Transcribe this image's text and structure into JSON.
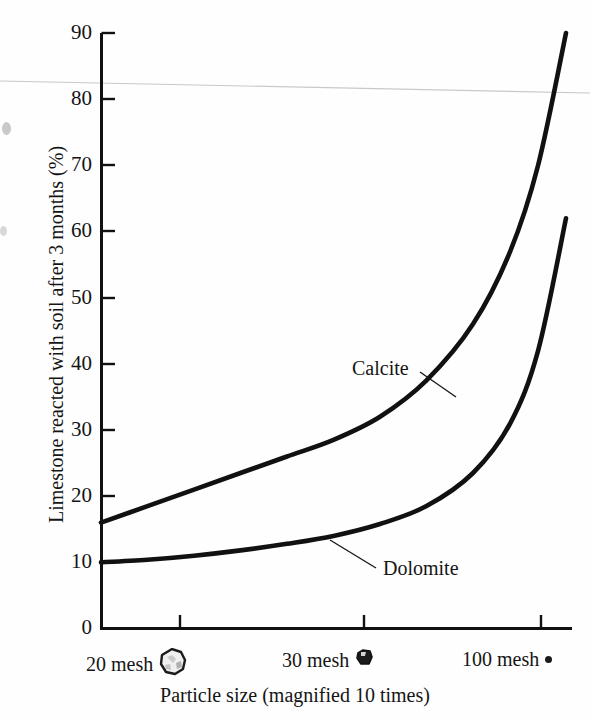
{
  "chart_data": {
    "type": "line",
    "title": "",
    "xlabel": "Particle size (magnified 10 times)",
    "ylabel": "Limestone reacted with soil after 3 months (%)",
    "ylim": [
      0,
      90
    ],
    "yticks": [
      0,
      10,
      20,
      30,
      40,
      50,
      60,
      70,
      80,
      90
    ],
    "ytick_labels": [
      "0",
      "10",
      "20",
      "30",
      "40",
      "50",
      "60",
      "70",
      "80",
      "90"
    ],
    "xtick_labels": [
      "20 mesh",
      "30 mesh",
      "100 mesh"
    ],
    "xtick_icons": [
      "rock-large-icon",
      "rock-small-icon",
      "dot-icon"
    ],
    "xtick_positions": [
      0.168,
      0.558,
      0.934
    ],
    "grid": false,
    "legend": "inline-annotations",
    "series": [
      {
        "name": "Calcite",
        "color": "#111111",
        "points": [
          {
            "x": 0.0,
            "y": 16.0
          },
          {
            "x": 0.1,
            "y": 18.5
          },
          {
            "x": 0.2,
            "y": 21.0
          },
          {
            "x": 0.3,
            "y": 23.5
          },
          {
            "x": 0.4,
            "y": 26.0
          },
          {
            "x": 0.5,
            "y": 28.5
          },
          {
            "x": 0.6,
            "y": 32.0
          },
          {
            "x": 0.7,
            "y": 37.5
          },
          {
            "x": 0.8,
            "y": 46.0
          },
          {
            "x": 0.88,
            "y": 57.0
          },
          {
            "x": 0.94,
            "y": 70.0
          },
          {
            "x": 1.0,
            "y": 90.0
          }
        ]
      },
      {
        "name": "Dolomite",
        "color": "#111111",
        "points": [
          {
            "x": 0.0,
            "y": 10.0
          },
          {
            "x": 0.1,
            "y": 10.4
          },
          {
            "x": 0.2,
            "y": 11.0
          },
          {
            "x": 0.3,
            "y": 11.8
          },
          {
            "x": 0.4,
            "y": 12.8
          },
          {
            "x": 0.5,
            "y": 14.0
          },
          {
            "x": 0.6,
            "y": 15.8
          },
          {
            "x": 0.7,
            "y": 18.5
          },
          {
            "x": 0.8,
            "y": 23.5
          },
          {
            "x": 0.88,
            "y": 31.0
          },
          {
            "x": 0.94,
            "y": 42.0
          },
          {
            "x": 1.0,
            "y": 62.0
          }
        ]
      }
    ],
    "annotations": [
      {
        "text": "Calcite",
        "label_x": 355,
        "label_y": 368,
        "leader_to_x": 438,
        "leader_to_y": 395
      },
      {
        "text": "Dolomite",
        "label_x": 385,
        "label_y": 573,
        "leader_to_x": 330,
        "leader_to_y": 541
      }
    ]
  },
  "axis": {
    "y_values": [
      "90",
      "80",
      "70",
      "60",
      "50",
      "40",
      "30",
      "20",
      "10",
      "0"
    ],
    "x_items": [
      {
        "label": "20 mesh",
        "icon": "rock-large-icon"
      },
      {
        "label": "30 mesh",
        "icon": "rock-small-icon"
      },
      {
        "label": "100 mesh",
        "icon": "dot-icon"
      }
    ],
    "x_title": "Particle size (magnified 10 times)",
    "y_title": "Limestone reacted with soil after 3 months (%)"
  },
  "series_labels": {
    "calcite": "Calcite",
    "dolomite": "Dolomite"
  },
  "colors": {
    "ink": "#111111",
    "paper": "#fefefe",
    "artifact": "#c8c8c8"
  }
}
